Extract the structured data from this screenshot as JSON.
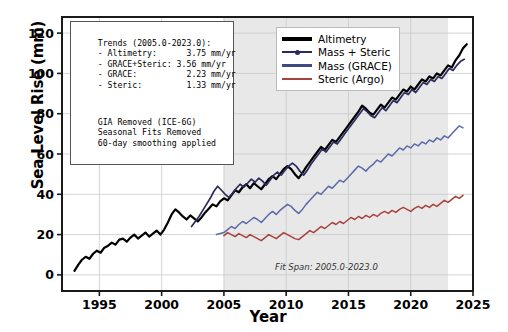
{
  "chart_data": {
    "type": "line",
    "title": "",
    "xlabel": "Year",
    "ylabel": "Sea Level Rise (mm)",
    "xlim": [
      1992.0,
      2025.0
    ],
    "ylim": [
      -8,
      128
    ],
    "xticks": [
      1995,
      2000,
      2005,
      2010,
      2015,
      2020,
      2025
    ],
    "yticks": [
      0,
      20,
      40,
      60,
      80,
      100,
      120
    ],
    "grid": true,
    "legend_position": "top-right",
    "shaded_span": {
      "label": "Fit Span",
      "x0": 2005.0,
      "x1": 2023.0,
      "color": "#e8e8e8"
    },
    "annotation": "Fit Span: 2005.0-2023.0",
    "series": [
      {
        "name": "Altimetry",
        "color": "#000000",
        "width": 2.2,
        "marker": "none",
        "x": [
          1993.0,
          1993.3,
          1993.6,
          1993.9,
          1994.2,
          1994.5,
          1994.8,
          1995.1,
          1995.4,
          1995.7,
          1996.0,
          1996.3,
          1996.6,
          1996.9,
          1997.2,
          1997.5,
          1997.8,
          1998.1,
          1998.4,
          1998.7,
          1999.0,
          1999.3,
          1999.6,
          1999.9,
          2000.2,
          2000.5,
          2000.8,
          2001.1,
          2001.4,
          2001.7,
          2002.0,
          2002.3,
          2002.6,
          2002.9,
          2003.2,
          2003.5,
          2003.8,
          2004.1,
          2004.4,
          2004.7,
          2005.0,
          2005.3,
          2005.6,
          2005.9,
          2006.2,
          2006.5,
          2006.8,
          2007.1,
          2007.4,
          2007.7,
          2008.0,
          2008.3,
          2008.6,
          2008.9,
          2009.2,
          2009.5,
          2009.8,
          2010.1,
          2010.4,
          2010.7,
          2011.0,
          2011.3,
          2011.6,
          2011.9,
          2012.2,
          2012.5,
          2012.8,
          2013.1,
          2013.4,
          2013.7,
          2014.0,
          2014.3,
          2014.6,
          2014.9,
          2015.2,
          2015.5,
          2015.8,
          2016.1,
          2016.4,
          2016.7,
          2017.0,
          2017.3,
          2017.6,
          2017.9,
          2018.2,
          2018.5,
          2018.8,
          2019.1,
          2019.4,
          2019.7,
          2020.0,
          2020.3,
          2020.6,
          2020.9,
          2021.2,
          2021.5,
          2021.8,
          2022.1,
          2022.4,
          2022.7,
          2023.0,
          2023.3,
          2023.6,
          2023.9,
          2024.2,
          2024.5
        ],
        "y": [
          2.0,
          5.0,
          7.5,
          9.0,
          8.0,
          10.5,
          12.0,
          11.0,
          13.5,
          14.5,
          16.0,
          15.0,
          17.5,
          18.0,
          16.5,
          18.5,
          20.0,
          18.0,
          19.5,
          21.0,
          19.0,
          20.5,
          22.0,
          20.0,
          22.5,
          26.0,
          30.0,
          32.5,
          31.0,
          29.0,
          27.5,
          29.5,
          28.0,
          26.5,
          28.5,
          31.0,
          33.0,
          35.0,
          34.0,
          36.5,
          38.0,
          37.0,
          39.5,
          42.0,
          41.0,
          43.5,
          45.0,
          43.0,
          45.5,
          44.0,
          42.5,
          45.0,
          47.5,
          49.0,
          47.5,
          50.0,
          52.5,
          54.0,
          52.5,
          50.0,
          48.0,
          50.5,
          53.5,
          56.0,
          58.5,
          61.0,
          63.5,
          62.0,
          64.5,
          67.0,
          66.0,
          68.5,
          71.0,
          73.5,
          76.0,
          78.5,
          81.0,
          84.0,
          82.5,
          80.5,
          79.5,
          82.0,
          84.5,
          83.0,
          85.5,
          88.0,
          87.0,
          89.5,
          92.0,
          91.0,
          93.5,
          92.0,
          94.5,
          97.0,
          96.0,
          98.5,
          97.5,
          100.0,
          99.0,
          101.5,
          104.0,
          103.0,
          106.5,
          109.0,
          112.5,
          114.5
        ]
      },
      {
        "name": "Mass + Steric",
        "color": "#2b2b5e",
        "width": 1.7,
        "marker": "dot",
        "x": [
          2002.4,
          2002.7,
          2003.0,
          2003.3,
          2003.6,
          2003.9,
          2004.2,
          2004.5,
          2004.8,
          2005.1,
          2005.4,
          2005.7,
          2006.0,
          2006.3,
          2006.6,
          2006.9,
          2007.2,
          2007.5,
          2007.8,
          2008.1,
          2008.4,
          2008.7,
          2009.0,
          2009.3,
          2009.6,
          2009.9,
          2010.2,
          2010.5,
          2010.8,
          2011.1,
          2011.4,
          2011.7,
          2012.0,
          2012.3,
          2012.6,
          2012.9,
          2013.2,
          2013.5,
          2013.8,
          2014.1,
          2014.4,
          2014.7,
          2015.0,
          2015.3,
          2015.6,
          2015.9,
          2016.2,
          2016.5,
          2016.8,
          2017.1,
          2017.4,
          2017.7,
          2018.0,
          2018.3,
          2018.6,
          2018.9,
          2019.2,
          2019.5,
          2019.8,
          2020.1,
          2020.4,
          2020.7,
          2021.0,
          2021.3,
          2021.6,
          2021.9,
          2022.2,
          2022.5,
          2022.8,
          2023.1,
          2023.4,
          2023.7,
          2024.0,
          2024.3
        ],
        "y": [
          24.0,
          26.5,
          29.0,
          32.0,
          35.0,
          38.0,
          41.5,
          44.0,
          42.0,
          40.0,
          38.5,
          40.5,
          43.0,
          45.0,
          43.5,
          45.5,
          47.5,
          46.0,
          48.0,
          46.5,
          44.5,
          47.0,
          49.5,
          51.0,
          49.5,
          52.0,
          54.0,
          55.5,
          54.0,
          51.5,
          49.5,
          52.0,
          55.0,
          57.5,
          60.0,
          62.5,
          61.0,
          63.5,
          66.0,
          65.0,
          67.5,
          70.0,
          72.5,
          75.0,
          77.5,
          80.0,
          82.5,
          81.0,
          79.0,
          78.0,
          80.5,
          83.0,
          81.5,
          84.0,
          86.5,
          85.5,
          88.0,
          90.5,
          89.5,
          92.0,
          90.5,
          93.0,
          95.5,
          94.5,
          97.0,
          96.0,
          98.5,
          97.5,
          100.0,
          102.5,
          101.5,
          104.0,
          106.0,
          107.0
        ]
      },
      {
        "name": "Mass (GRACE)",
        "color": "#5c6aa8",
        "width": 1.5,
        "marker": "none",
        "x": [
          2004.4,
          2004.7,
          2005.0,
          2005.3,
          2005.6,
          2005.9,
          2006.2,
          2006.5,
          2006.8,
          2007.1,
          2007.4,
          2007.7,
          2008.0,
          2008.3,
          2008.6,
          2008.9,
          2009.2,
          2009.5,
          2009.8,
          2010.1,
          2010.4,
          2010.7,
          2011.0,
          2011.3,
          2011.6,
          2011.9,
          2012.2,
          2012.5,
          2012.8,
          2013.1,
          2013.4,
          2013.7,
          2014.0,
          2014.3,
          2014.6,
          2014.9,
          2015.2,
          2015.5,
          2015.8,
          2016.1,
          2016.4,
          2016.7,
          2017.0,
          2017.3,
          2017.6,
          2017.9,
          2018.2,
          2018.5,
          2018.8,
          2019.1,
          2019.4,
          2019.7,
          2020.0,
          2020.3,
          2020.6,
          2020.9,
          2021.2,
          2021.5,
          2021.8,
          2022.1,
          2022.4,
          2022.7,
          2023.0,
          2023.3,
          2023.6,
          2023.9,
          2024.2
        ],
        "y": [
          20.0,
          20.5,
          21.0,
          22.5,
          24.0,
          23.0,
          25.0,
          26.5,
          25.5,
          27.0,
          28.5,
          27.5,
          26.0,
          28.0,
          30.0,
          31.5,
          30.0,
          32.0,
          33.5,
          35.0,
          34.0,
          32.0,
          30.5,
          32.5,
          35.0,
          37.0,
          39.0,
          41.0,
          40.0,
          42.0,
          44.0,
          43.0,
          45.0,
          47.0,
          46.0,
          48.0,
          50.0,
          52.0,
          54.0,
          53.0,
          51.5,
          53.5,
          55.0,
          57.0,
          56.0,
          58.0,
          60.0,
          59.0,
          61.0,
          63.0,
          62.0,
          64.0,
          63.0,
          65.0,
          64.0,
          66.0,
          65.0,
          67.0,
          66.0,
          68.0,
          67.0,
          69.0,
          68.0,
          70.0,
          72.0,
          74.0,
          73.0
        ]
      },
      {
        "name": "Steric (Argo)",
        "color": "#a8423c",
        "width": 1.5,
        "marker": "none",
        "x": [
          2005.0,
          2005.3,
          2005.6,
          2005.9,
          2006.2,
          2006.5,
          2006.8,
          2007.1,
          2007.4,
          2007.7,
          2008.0,
          2008.3,
          2008.6,
          2008.9,
          2009.2,
          2009.5,
          2009.8,
          2010.1,
          2010.4,
          2010.7,
          2011.0,
          2011.3,
          2011.6,
          2011.9,
          2012.2,
          2012.5,
          2012.8,
          2013.1,
          2013.4,
          2013.7,
          2014.0,
          2014.3,
          2014.6,
          2014.9,
          2015.2,
          2015.5,
          2015.8,
          2016.1,
          2016.4,
          2016.7,
          2017.0,
          2017.3,
          2017.6,
          2017.9,
          2018.2,
          2018.5,
          2018.8,
          2019.1,
          2019.4,
          2019.7,
          2020.0,
          2020.3,
          2020.6,
          2020.9,
          2021.2,
          2021.5,
          2021.8,
          2022.1,
          2022.4,
          2022.7,
          2023.0,
          2023.3,
          2023.6,
          2023.9,
          2024.2
        ],
        "y": [
          19.5,
          21.0,
          20.0,
          19.0,
          20.5,
          19.5,
          18.5,
          20.0,
          19.0,
          18.0,
          17.0,
          18.5,
          20.0,
          19.0,
          18.0,
          19.5,
          21.0,
          20.0,
          19.0,
          18.0,
          17.5,
          19.0,
          20.5,
          22.0,
          21.0,
          22.5,
          24.0,
          23.0,
          24.5,
          26.0,
          25.0,
          26.5,
          25.5,
          27.0,
          28.5,
          27.5,
          29.0,
          28.0,
          29.5,
          28.5,
          30.0,
          29.0,
          30.5,
          31.5,
          30.5,
          32.0,
          31.0,
          32.5,
          33.5,
          32.5,
          31.5,
          33.0,
          34.0,
          33.0,
          34.5,
          33.5,
          35.0,
          34.0,
          35.5,
          37.0,
          36.0,
          37.5,
          39.0,
          38.0,
          39.5
        ]
      }
    ]
  },
  "trends_box": {
    "header": "Trends (2005.0-2023.0):",
    "rows": [
      "- Altimetry:      3.75 mm/yr",
      "- GRACE+Steric: 3.56 mm/yr",
      "- GRACE:          2.23 mm/yr",
      "- Steric:         1.33 mm/yr"
    ],
    "notes": [
      "GIA Removed (ICE-6G)",
      "Seasonal Fits Removed",
      "60-day smoothing applied"
    ]
  },
  "legend": {
    "items": [
      {
        "label": "Altimetry",
        "color": "#000000",
        "marker": "none"
      },
      {
        "label": "Mass + Steric",
        "color": "#2b2b5e",
        "marker": "dot"
      },
      {
        "label": "Mass (GRACE)",
        "color": "#3f4a80",
        "marker": "none"
      },
      {
        "label": "Steric (Argo)",
        "color": "#a8423c",
        "marker": "none"
      }
    ]
  }
}
